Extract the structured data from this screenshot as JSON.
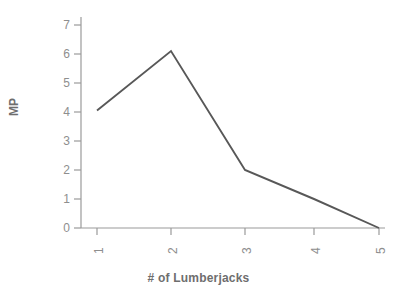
{
  "chart_data": {
    "type": "line",
    "title": "",
    "subtitle": "",
    "xlabel": "# of Lumberjacks",
    "ylabel": "MP",
    "x": [
      1,
      2,
      3,
      4,
      5
    ],
    "values": [
      4.05,
      6.1,
      2.0,
      1.0,
      0.0
    ],
    "series": [
      {
        "name": "MP",
        "values": [
          4.05,
          6.1,
          2.0,
          1.0,
          0.0
        ]
      }
    ],
    "xticklabels": [
      "1",
      "2",
      "3",
      "4",
      "5"
    ],
    "yticklabels": [
      "0",
      "1",
      "2",
      "3",
      "4",
      "5",
      "6",
      "7"
    ],
    "yticks": [
      0,
      1,
      2,
      3,
      4,
      5,
      6,
      7
    ],
    "xlim": [
      1,
      5
    ],
    "ylim": [
      0,
      7
    ],
    "grid": false,
    "legend": false,
    "legend_position": "none",
    "line_color": "#585858",
    "axis_color": "#9a9a9a",
    "tick_label_color": "#8e8e8e",
    "axis_title_color": "#6e6e6e",
    "background_color": "#ffffff",
    "annotations": []
  },
  "geometry": {
    "plot_left": 81,
    "plot_right": 385,
    "plot_top": 17,
    "plot_bottom": 228,
    "x_pixels": [
      97,
      171,
      245,
      314,
      379
    ],
    "y_pixels_per_unit": 29.0,
    "y_zero_pixel": 228
  }
}
